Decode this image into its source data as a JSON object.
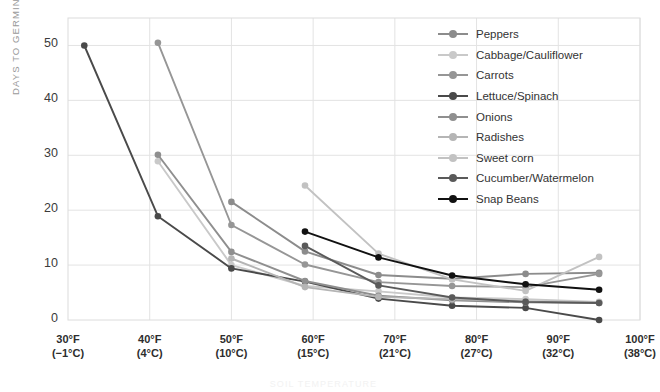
{
  "chart_data": {
    "type": "line",
    "title": "",
    "xlabel": "SOIL TEMPERATURE",
    "ylabel": "DAYS TO GERMINATION",
    "xlim": [
      30,
      100
    ],
    "ylim": [
      0,
      55
    ],
    "grid": true,
    "legend_position": "top-right",
    "xticks": [
      {
        "f": "30°F",
        "c": "(−1°C)"
      },
      {
        "f": "40°F",
        "c": "(4°C)"
      },
      {
        "f": "50°F",
        "c": "(10°C)"
      },
      {
        "f": "60°F",
        "c": "(15°C)"
      },
      {
        "f": "70°F",
        "c": "(21°C)"
      },
      {
        "f": "80°F",
        "c": "(27°C)"
      },
      {
        "f": "90°F",
        "c": "(32°C)"
      },
      {
        "f": "100°F",
        "c": "(38°C)"
      }
    ],
    "yticks": [
      0,
      10,
      20,
      30,
      40,
      50
    ],
    "series": [
      {
        "name": "Peppers",
        "color": "#8c8c8c",
        "x": [
          50,
          59,
          68,
          77,
          86,
          95
        ],
        "values": [
          21.5,
          12.5,
          8.2,
          7.5,
          8.4,
          8.6
        ]
      },
      {
        "name": "Cabbage/Cauliflower",
        "color": "#c9c9c9",
        "x": [
          41,
          50,
          59,
          68,
          77,
          86,
          95
        ],
        "values": [
          28.9,
          10.0,
          6.2,
          5.2,
          4.1,
          3.8,
          3.3
        ]
      },
      {
        "name": "Carrots",
        "color": "#969696",
        "x": [
          41,
          50,
          59,
          68,
          77,
          86,
          95
        ],
        "values": [
          50.5,
          17.3,
          10.1,
          6.9,
          6.2,
          6.0,
          8.4
        ]
      },
      {
        "name": "Lettuce/Spinach",
        "color": "#4a4a4a",
        "x": [
          32,
          41,
          50,
          59,
          68,
          77,
          86,
          95
        ],
        "values": [
          50.0,
          18.9,
          9.4,
          7.0,
          3.9,
          2.6,
          2.2,
          0.0
        ]
      },
      {
        "name": "Onions",
        "color": "#8f8f8f",
        "x": [
          41,
          50,
          59,
          68,
          77,
          86,
          95
        ],
        "values": [
          30.1,
          12.4,
          7.1,
          4.4,
          3.6,
          3.2,
          3.1
        ]
      },
      {
        "name": "Radishes",
        "color": "#b5b5b5",
        "x": [
          50,
          59,
          68,
          77,
          86,
          95
        ],
        "values": [
          11.2,
          6.0,
          4.2,
          3.8,
          3.4,
          3.2
        ]
      },
      {
        "name": "Sweet corn",
        "color": "#c2c2c2",
        "x": [
          59,
          68,
          77,
          86,
          95
        ],
        "values": [
          24.5,
          12.1,
          7.4,
          5.3,
          11.5
        ]
      },
      {
        "name": "Cucumber/Watermelon",
        "color": "#5a5a5a",
        "x": [
          59,
          68,
          77,
          86,
          95
        ],
        "values": [
          13.5,
          6.3,
          4.1,
          3.3,
          3.1
        ]
      },
      {
        "name": "Snap Beans",
        "color": "#111111",
        "x": [
          59,
          68,
          77,
          86,
          95
        ],
        "values": [
          16.1,
          11.4,
          8.1,
          6.5,
          5.5
        ]
      }
    ]
  }
}
